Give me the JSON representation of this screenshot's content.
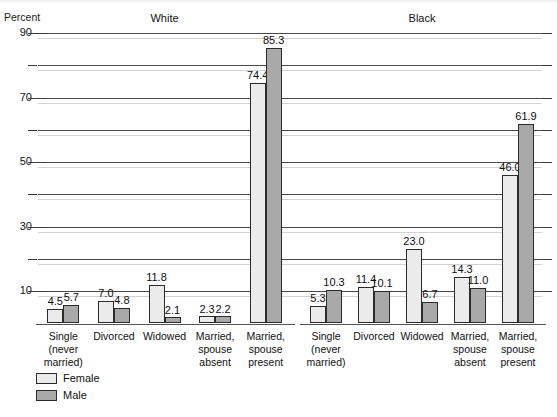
{
  "chart_data": {
    "type": "bar",
    "title": "",
    "subtitle": "",
    "xlabel": "",
    "ylabel": "Percent",
    "ylim": [
      0,
      90
    ],
    "yticks_labeled": [
      10,
      30,
      50,
      70,
      90
    ],
    "yticks_unlabeled": [
      20,
      40,
      60,
      80
    ],
    "grid": true,
    "legend_position": "bottom-left",
    "categories": [
      "Single\n(never\nmarried)",
      "Divorced",
      "Widowed",
      "Married,\nspouse\nabsent",
      "Married,\nspouse\npresent"
    ],
    "panels": [
      {
        "name": "White",
        "series": [
          {
            "name": "Female",
            "values": [
              4.5,
              7.0,
              11.8,
              2.3,
              74.4
            ]
          },
          {
            "name": "Male",
            "values": [
              5.7,
              4.8,
              2.1,
              2.2,
              85.3
            ]
          }
        ]
      },
      {
        "name": "Black",
        "series": [
          {
            "name": "Female",
            "values": [
              5.3,
              11.4,
              23.0,
              14.3,
              46.0
            ]
          },
          {
            "name": "Male",
            "values": [
              10.3,
              10.1,
              6.7,
              11.0,
              61.9
            ]
          }
        ]
      }
    ],
    "legend": [
      {
        "label": "Female",
        "color": "#ebebeb"
      },
      {
        "label": "Male",
        "color": "#a9a9a9"
      }
    ],
    "colors": {
      "female": "#ebebeb",
      "male": "#a9a9a9",
      "bar_outline": "#2b2b2b",
      "gridline": "#4a4a4a",
      "gridline_ghost": "#d2d2d2",
      "text": "#111111",
      "background": "#ffffff"
    }
  }
}
